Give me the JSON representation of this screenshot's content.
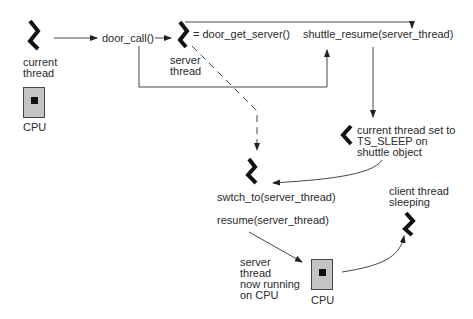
{
  "nodes": {
    "current_thread": {
      "icon": "thread-icon",
      "label_line1": "current",
      "label_line2": "thread"
    },
    "cpu_left": {
      "label": "CPU"
    },
    "door_call": {
      "label": "door_call()"
    },
    "server_thread": {
      "icon": "thread-icon",
      "label_line1": "server",
      "label_line2": "thread",
      "assignment": "= door_get_server()"
    },
    "shuttle_resume": {
      "label": "shuttle_resume(server_thread)"
    },
    "sleep_state": {
      "icon": "thread-icon",
      "line1": "current thread set to",
      "line2": "TS_SLEEP on",
      "line3": "shuttle object"
    },
    "switch_thread": {
      "icon": "thread-icon",
      "label": "swtch_to(server_thread)"
    },
    "resume": {
      "label": "resume(server_thread)"
    },
    "server_running": {
      "line1": "server",
      "line2": "thread",
      "line3": "now running",
      "line4": "on CPU"
    },
    "cpu_bottom": {
      "label": "CPU"
    },
    "client_thread": {
      "icon": "thread-icon",
      "line1": "client thread",
      "line2": "sleeping"
    }
  },
  "colors": {
    "line": "#555555",
    "thread": "#111111",
    "cpu_fill": "#c4c4c4"
  }
}
